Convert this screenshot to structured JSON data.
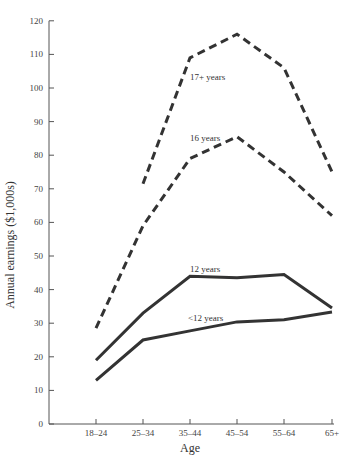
{
  "chart_data": {
    "type": "line",
    "title": "",
    "xlabel": "Age",
    "ylabel": "Annual earnings ($1,000s)",
    "categories": [
      "18–24",
      "25–34",
      "35–44",
      "45–54",
      "55–64",
      "65+"
    ],
    "ylim": [
      0,
      120
    ],
    "yticks": [
      0,
      10,
      20,
      30,
      40,
      50,
      60,
      70,
      80,
      90,
      100,
      110,
      120
    ],
    "grid": false,
    "legend": "inline labels",
    "series": [
      {
        "name": "17+ years",
        "style": "dashed",
        "values": [
          null,
          71.5,
          109,
          116,
          106,
          75
        ]
      },
      {
        "name": "16 years",
        "style": "dashed",
        "values": [
          28.5,
          59,
          79,
          85.5,
          75,
          62
        ]
      },
      {
        "name": "12 years",
        "style": "solid",
        "values": [
          19,
          33,
          44,
          43.5,
          44.5,
          34.5
        ]
      },
      {
        "name": "<12 years",
        "style": "solid",
        "values": [
          13,
          25,
          27.7,
          30.4,
          31,
          33.3
        ]
      }
    ]
  }
}
